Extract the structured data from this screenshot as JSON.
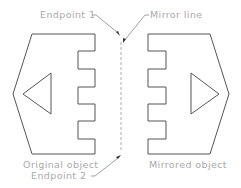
{
  "diagram": {
    "type": "mirror-command-illustration",
    "labels": {
      "endpoint1": "Endpoint 1",
      "mirror_line": "Mirror line",
      "original_object": "Original object",
      "endpoint2": "Endpoint 2",
      "mirrored_object": "Mirrored object"
    },
    "colors": {
      "outline": "#555555",
      "label_text": "#a9a9a9",
      "leader": "#777777",
      "mirror_line": "#999999",
      "background": "#ffffff"
    },
    "objects": {
      "original": {
        "outline_points": "32,34 95,34 95,51 78,51 78,69 95,69 95,87 78,87 78,104 95,104 95,121 78,121 78,139 95,139 95,154 32,154 13,94",
        "triangle_points": "51,73 51,114 23,94",
        "triangle_direction": "left"
      },
      "mirrored": {
        "outline_points": "210,34 148,34 148,51 166,51 166,69 148,69 148,87 166,87 166,104 148,104 148,121 166,121 166,139 148,139 148,154 210,154 229,94",
        "triangle_points": "191,73 191,114 219,94",
        "triangle_direction": "right"
      }
    },
    "mirror_line": {
      "x": 121,
      "y1": 42,
      "y2": 152
    }
  }
}
